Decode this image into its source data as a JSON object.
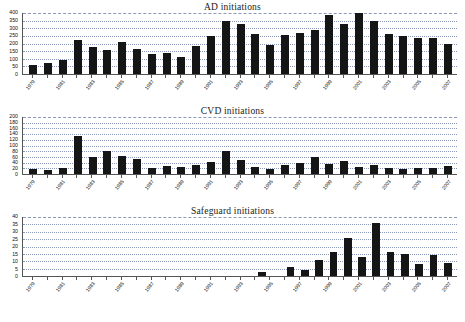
{
  "figure": {
    "width": 465,
    "height": 322,
    "background": "#ffffff",
    "bar_color": "#151515",
    "grid_color": "#8c98b8",
    "axis_color": "#555555"
  },
  "years": [
    1979,
    1980,
    1981,
    1982,
    1983,
    1984,
    1985,
    1986,
    1987,
    1988,
    1989,
    1990,
    1991,
    1992,
    1993,
    1994,
    1995,
    1996,
    1997,
    1998,
    1999,
    2000,
    2001,
    2002,
    2003,
    2004,
    2005,
    2006,
    2007
  ],
  "xtick_labels": [
    "1979",
    "",
    "1981",
    "",
    "1983",
    "",
    "1985",
    "",
    "1987",
    "",
    "1989",
    "",
    "1991",
    "",
    "1993",
    "",
    "1995",
    "",
    "1997",
    "",
    "1999",
    "",
    "2001",
    "",
    "2003",
    "",
    "2005",
    "",
    "2007"
  ],
  "charts": [
    {
      "id": "ad",
      "title": "AD initiations",
      "yticks": [
        0,
        50,
        100,
        150,
        200,
        250,
        300,
        350,
        400
      ],
      "ymax": 400,
      "values": [
        60,
        72,
        95,
        222,
        180,
        158,
        210,
        162,
        128,
        138,
        112,
        185,
        250,
        345,
        325,
        262,
        190,
        255,
        272,
        290,
        390,
        330,
        400,
        350,
        265,
        252,
        238,
        238,
        200
      ]
    },
    {
      "id": "cvd",
      "title": "CVD initiations",
      "yticks": [
        0,
        20,
        40,
        60,
        80,
        100,
        120,
        140,
        160,
        180,
        200
      ],
      "ymax": 200,
      "values": [
        18,
        14,
        20,
        133,
        60,
        80,
        64,
        52,
        22,
        28,
        24,
        32,
        42,
        80,
        50,
        26,
        18,
        32,
        38,
        58,
        34,
        44,
        24,
        32,
        22,
        18,
        20,
        22,
        28
      ]
    },
    {
      "id": "sg",
      "title": "Safeguard initiations",
      "yticks": [
        0,
        5,
        10,
        15,
        20,
        25,
        30,
        35,
        40
      ],
      "ymax": 40,
      "values": [
        0,
        0,
        0,
        0,
        0,
        0,
        0,
        0,
        0,
        0,
        0,
        0,
        0,
        0,
        0,
        0,
        2.5,
        0,
        6,
        4,
        11,
        16,
        26,
        13,
        36,
        16,
        15,
        8,
        14,
        9
      ]
    }
  ],
  "chart_data": [
    {
      "type": "bar",
      "title": "AD initiations",
      "xlabel": "",
      "ylabel": "",
      "ylim": [
        0,
        400
      ],
      "grid": true,
      "legend": "none",
      "categories": [
        "1979",
        "1980",
        "1981",
        "1982",
        "1983",
        "1984",
        "1985",
        "1986",
        "1987",
        "1988",
        "1989",
        "1990",
        "1991",
        "1992",
        "1993",
        "1994",
        "1995",
        "1996",
        "1997",
        "1998",
        "1999",
        "2000",
        "2001",
        "2002",
        "2003",
        "2004",
        "2005",
        "2006",
        "2007"
      ],
      "values": [
        60,
        72,
        95,
        222,
        180,
        158,
        210,
        162,
        128,
        138,
        112,
        185,
        250,
        345,
        325,
        262,
        190,
        255,
        272,
        290,
        390,
        330,
        400,
        350,
        265,
        252,
        238,
        238,
        200
      ],
      "ytick_labels": [
        "0",
        "50",
        "100",
        "150",
        "200",
        "250",
        "300",
        "350",
        "400"
      ]
    },
    {
      "type": "bar",
      "title": "CVD initiations",
      "xlabel": "",
      "ylabel": "",
      "ylim": [
        0,
        200
      ],
      "grid": true,
      "legend": "none",
      "categories": [
        "1979",
        "1980",
        "1981",
        "1982",
        "1983",
        "1984",
        "1985",
        "1986",
        "1987",
        "1988",
        "1989",
        "1990",
        "1991",
        "1992",
        "1993",
        "1994",
        "1995",
        "1996",
        "1997",
        "1998",
        "1999",
        "2000",
        "2001",
        "2002",
        "2003",
        "2004",
        "2005",
        "2006",
        "2007"
      ],
      "values": [
        18,
        14,
        20,
        133,
        60,
        80,
        64,
        52,
        22,
        28,
        24,
        32,
        42,
        80,
        50,
        26,
        18,
        32,
        38,
        58,
        34,
        44,
        24,
        32,
        22,
        18,
        20,
        22,
        28
      ],
      "ytick_labels": [
        "0",
        "20",
        "40",
        "60",
        "80",
        "100",
        "120",
        "140",
        "160",
        "180",
        "200"
      ]
    },
    {
      "type": "bar",
      "title": "Safeguard initiations",
      "xlabel": "",
      "ylabel": "",
      "ylim": [
        0,
        40
      ],
      "grid": true,
      "legend": "none",
      "categories": [
        "1979",
        "1980",
        "1981",
        "1982",
        "1983",
        "1984",
        "1985",
        "1986",
        "1987",
        "1988",
        "1989",
        "1990",
        "1991",
        "1992",
        "1993",
        "1994",
        "1995",
        "1996",
        "1997",
        "1998",
        "1999",
        "2000",
        "2001",
        "2002",
        "2003",
        "2004",
        "2005",
        "2006",
        "2007"
      ],
      "values": [
        0,
        0,
        0,
        0,
        0,
        0,
        0,
        0,
        0,
        0,
        0,
        0,
        0,
        0,
        0,
        0,
        2.5,
        0,
        6,
        4,
        11,
        16,
        26,
        13,
        36,
        16,
        15,
        8,
        14,
        9
      ],
      "ytick_labels": [
        "0",
        "5",
        "10",
        "15",
        "20",
        "25",
        "30",
        "35",
        "40"
      ]
    }
  ]
}
